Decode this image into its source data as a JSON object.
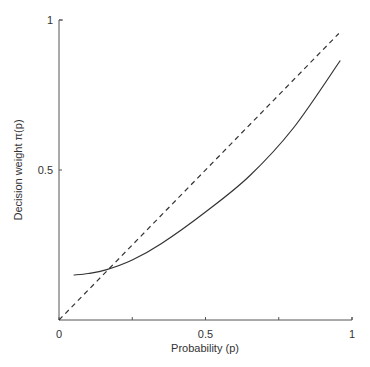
{
  "chart_data": {
    "type": "line",
    "title": "",
    "xlabel": "Probability (p)",
    "ylabel": "Decision weight π(p)",
    "xlim": [
      0,
      1
    ],
    "ylim": [
      0,
      1
    ],
    "x_ticks": [
      {
        "value": 0,
        "label": "0"
      },
      {
        "value": 0.5,
        "label": "0.5"
      },
      {
        "value": 1,
        "label": "1"
      }
    ],
    "x_minor_ticks": [
      0.25,
      0.75
    ],
    "y_ticks": [
      {
        "value": 0.5,
        "label": "0.5"
      },
      {
        "value": 1,
        "label": "1"
      }
    ],
    "grid": false,
    "legend": null,
    "series": [
      {
        "name": "Decision weight π(p)",
        "style": "solid",
        "x": [
          0.05,
          0.1,
          0.16,
          0.25,
          0.35,
          0.5,
          0.65,
          0.8,
          0.96
        ],
        "y": [
          0.15,
          0.155,
          0.167,
          0.2,
          0.255,
          0.36,
          0.48,
          0.64,
          0.865
        ]
      },
      {
        "name": "π(p) = p (reference)",
        "style": "dashed",
        "x": [
          0,
          0.955
        ],
        "y": [
          0,
          0.955
        ]
      }
    ]
  }
}
